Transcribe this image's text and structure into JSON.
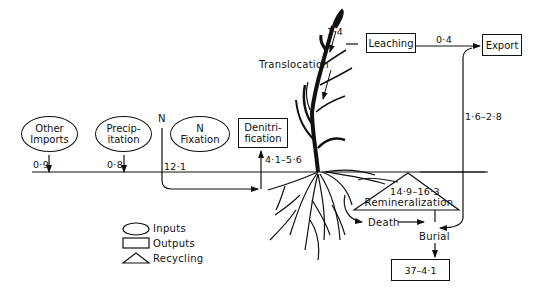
{
  "diagram": {
    "type": "nitrogen-cycle-flow-diagram",
    "inputs": [
      {
        "id": "other-imports",
        "label_line1": "Other",
        "label_line2": "Imports",
        "value": "0·9"
      },
      {
        "id": "precipitation",
        "label_line1": "Precip-",
        "label_line2": "itation",
        "value": "0·8"
      },
      {
        "id": "n-fixation",
        "label_line1": "N",
        "label_line2": "Fixation",
        "value": "12·1"
      }
    ],
    "n_label": "N",
    "outputs": [
      {
        "id": "denitrification",
        "label_line1": "Denitri-",
        "label_line2": "fication",
        "value": "4·1–5·6"
      },
      {
        "id": "leaching",
        "label": "Leaching",
        "value": "0·4"
      },
      {
        "id": "export",
        "label": "Export",
        "value": "1·6–2·8"
      },
      {
        "id": "burial-store",
        "label": "37–4·1"
      }
    ],
    "recycling": {
      "label": "Remineralization",
      "value": "14·9–16·3"
    },
    "flows": {
      "translocation": "Translocation",
      "translocation_value": "1·4",
      "death": "Death",
      "burial": "Burial"
    },
    "legend": [
      {
        "shape": "oval",
        "label": "Inputs"
      },
      {
        "shape": "rectangle",
        "label": "Outputs"
      },
      {
        "shape": "triangle",
        "label": "Recycling"
      }
    ]
  }
}
